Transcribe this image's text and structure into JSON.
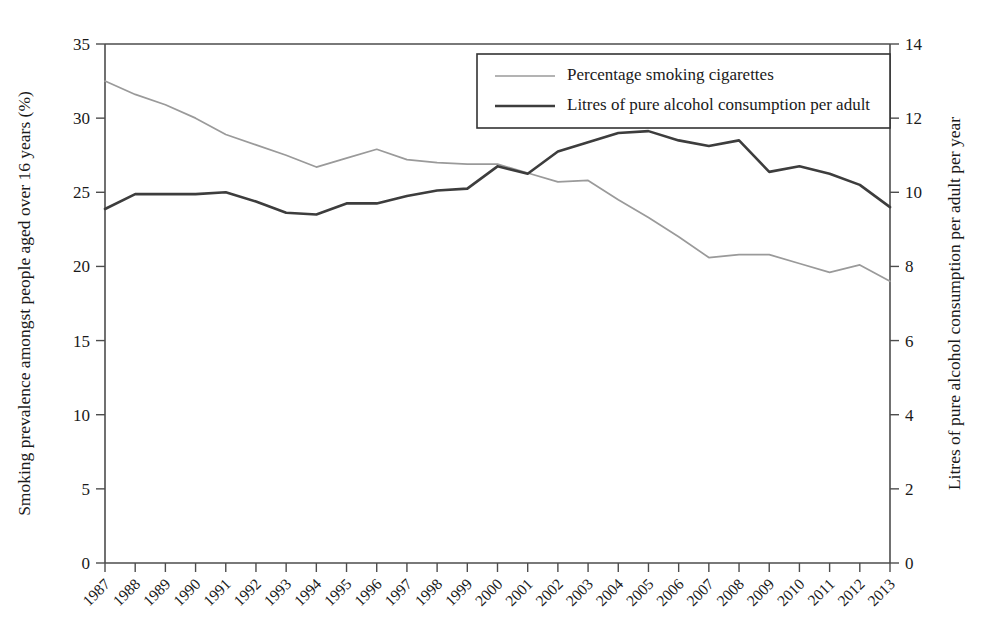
{
  "chart_data": {
    "type": "line",
    "title": "",
    "xlabel": "",
    "ylabel": "Smoking prevalence amongst people aged over 16 years (%)",
    "y2label": "Litres of pure alcohol consumption per adult per year",
    "grid": false,
    "legend_position": "top-center-right",
    "ylim": [
      0,
      35
    ],
    "y2lim": [
      0,
      14
    ],
    "yticks": [
      0,
      5,
      10,
      15,
      20,
      25,
      30,
      35
    ],
    "y2ticks": [
      0,
      2,
      4,
      6,
      8,
      10,
      12,
      14
    ],
    "categories": [
      "1987",
      "1988",
      "1989",
      "1990",
      "1991",
      "1992",
      "1993",
      "1994",
      "1995",
      "1996",
      "1997",
      "1998",
      "1999",
      "2000",
      "2001",
      "2002",
      "2003",
      "2004",
      "2005",
      "2006",
      "2007",
      "2008",
      "2009",
      "2010",
      "2011",
      "2012",
      "2013"
    ],
    "series": [
      {
        "name": "Percentage smoking cigarettes",
        "axis": "left",
        "color": "#9a9a9a",
        "width": 1.7,
        "values": [
          32.5,
          31.6,
          30.9,
          30.0,
          28.9,
          28.2,
          27.5,
          26.7,
          27.3,
          27.9,
          27.2,
          27.0,
          26.9,
          26.9,
          26.3,
          25.7,
          25.8,
          24.5,
          23.3,
          22.0,
          20.6,
          20.8,
          20.8,
          20.2,
          19.6,
          20.1,
          19.0
        ]
      },
      {
        "name": "Litres of pure alcohol consumption per adult",
        "axis": "right",
        "color": "#3d3d3d",
        "width": 2.6,
        "values": [
          9.55,
          9.95,
          9.95,
          9.95,
          10.0,
          9.75,
          9.45,
          9.4,
          9.7,
          9.7,
          9.9,
          10.05,
          10.1,
          10.7,
          10.5,
          11.1,
          11.35,
          11.6,
          11.65,
          11.4,
          11.25,
          11.4,
          10.55,
          10.7,
          10.5,
          10.2,
          9.6
        ]
      }
    ]
  },
  "legend": {
    "entries": [
      "Percentage smoking cigarettes",
      "Litres of pure alcohol consumption per adult"
    ]
  }
}
